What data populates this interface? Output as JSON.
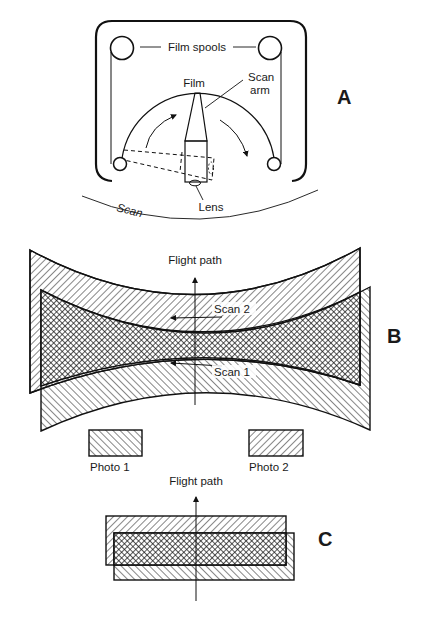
{
  "diagram": {
    "panel_a": {
      "label": "A",
      "film_spools_label": "Film spools",
      "film_label": "Film",
      "scan_arm_label_line1": "Scan",
      "scan_arm_label_line2": "arm",
      "lens_label": "Lens",
      "scan_label": "Scan"
    },
    "panel_b": {
      "label": "B",
      "flight_path_label": "Flight path",
      "scan2_label": "Scan 2",
      "scan1_label": "Scan 1",
      "photo1_label": "Photo 1",
      "photo2_label": "Photo 2"
    },
    "panel_c": {
      "label": "C",
      "flight_path_label": "Flight path"
    },
    "colors": {
      "ink": "#111111",
      "background": "#ffffff"
    }
  }
}
